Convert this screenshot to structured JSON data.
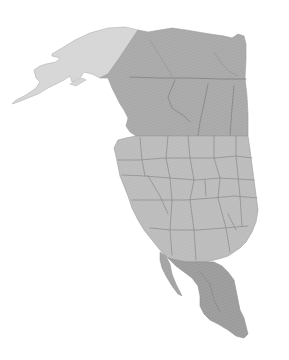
{
  "map": {
    "description": "Grayscale stylized map of North America",
    "regions": [
      {
        "id": "alaska",
        "name": "Alaska",
        "fill": "#d6d6d6"
      },
      {
        "id": "canada",
        "name": "Canada",
        "fill": "#a9a9a9"
      },
      {
        "id": "usa",
        "name": "United States",
        "fill": "#bcbcbc"
      },
      {
        "id": "mexico",
        "name": "Mexico",
        "fill": "#9c9c9c"
      }
    ],
    "colors": {
      "background": "#ffffff",
      "border": "#7a7a7a",
      "coast": "#8a8a8a"
    }
  }
}
